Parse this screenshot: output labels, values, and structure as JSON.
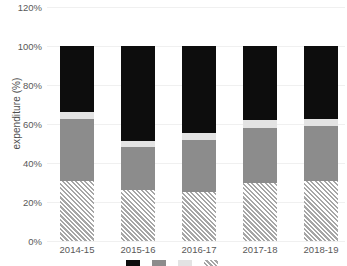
{
  "chart_data": {
    "type": "bar",
    "stacked": true,
    "title": "",
    "xlabel": "",
    "ylabel": "expenditure (%)",
    "ylim": [
      0,
      120
    ],
    "ytick_labels": [
      "0%",
      "20%",
      "40%",
      "60%",
      "80%",
      "100%",
      "120%"
    ],
    "ytick_values": [
      0,
      20,
      40,
      60,
      80,
      100,
      120
    ],
    "grid": true,
    "legend_position": "bottom",
    "categories": [
      "2014-15",
      "2015-16",
      "2016-17",
      "2017-18",
      "2018-19"
    ],
    "series": [
      {
        "name": "hatched-segment",
        "color": "#f2f2f2",
        "pattern": "diagonal-hatch",
        "legend_label": "",
        "values": [
          31,
          26,
          25,
          30,
          31
        ]
      },
      {
        "name": "gray-segment",
        "color": "#8c8c8c",
        "pattern": "solid",
        "legend_label": "",
        "values": [
          31.5,
          22,
          27,
          28,
          28
        ]
      },
      {
        "name": "light-gray-segment",
        "color": "#e3e3e3",
        "pattern": "solid",
        "legend_label": "",
        "values": [
          3.5,
          3.5,
          3.5,
          4,
          3.5
        ]
      },
      {
        "name": "black-segment",
        "color": "#0d0d0d",
        "pattern": "solid",
        "legend_label": "",
        "values": [
          34,
          48.5,
          44.5,
          38,
          37.5
        ]
      }
    ],
    "totals": [
      100,
      100,
      100,
      100,
      100
    ]
  },
  "axis": {
    "ylabel": "expenditure (%)",
    "yticks": [
      {
        "label": "120%",
        "value": 120
      },
      {
        "label": "100%",
        "value": 100
      },
      {
        "label": "80%",
        "value": 80
      },
      {
        "label": "60%",
        "value": 60
      },
      {
        "label": "40%",
        "value": 40
      },
      {
        "label": "20%",
        "value": 20
      },
      {
        "label": "0%",
        "value": 0
      }
    ],
    "xticks": [
      "2014-15",
      "2015-16",
      "2016-17",
      "2017-18",
      "2018-19"
    ]
  },
  "legend": {
    "clipped": true,
    "items": [
      {
        "swatch": "black",
        "label": ""
      },
      {
        "swatch": "gray",
        "label": ""
      },
      {
        "swatch": "light",
        "label": ""
      },
      {
        "swatch": "hatch",
        "label": ""
      }
    ]
  }
}
